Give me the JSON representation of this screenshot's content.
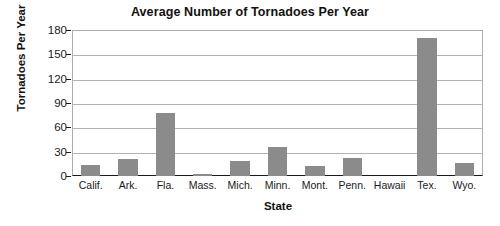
{
  "chart_data": {
    "type": "bar",
    "title": "Average Number of Tornadoes Per Year",
    "xlabel": "State",
    "ylabel": "Tornadoes Per Year",
    "categories": [
      "Calif.",
      "Ark.",
      "Fla.",
      "Mass.",
      "Mich.",
      "Minn.",
      "Mont.",
      "Penn.",
      "Hawaii",
      "Tex.",
      "Wyo."
    ],
    "values": [
      14,
      21,
      78,
      3,
      18,
      36,
      12,
      22,
      0,
      170,
      16
    ],
    "ylim": [
      0,
      180
    ],
    "yticks": [
      0,
      30,
      60,
      90,
      120,
      150,
      180
    ],
    "ytick_labels": [
      "0",
      "30",
      "60",
      "90",
      "120",
      "150",
      "180"
    ],
    "grid": true,
    "legend": "none",
    "bar_color": "#8b8b8b",
    "grid_color": "#b3b3b3",
    "axis_color": "#1a1a1a",
    "background": "#ffffff"
  }
}
